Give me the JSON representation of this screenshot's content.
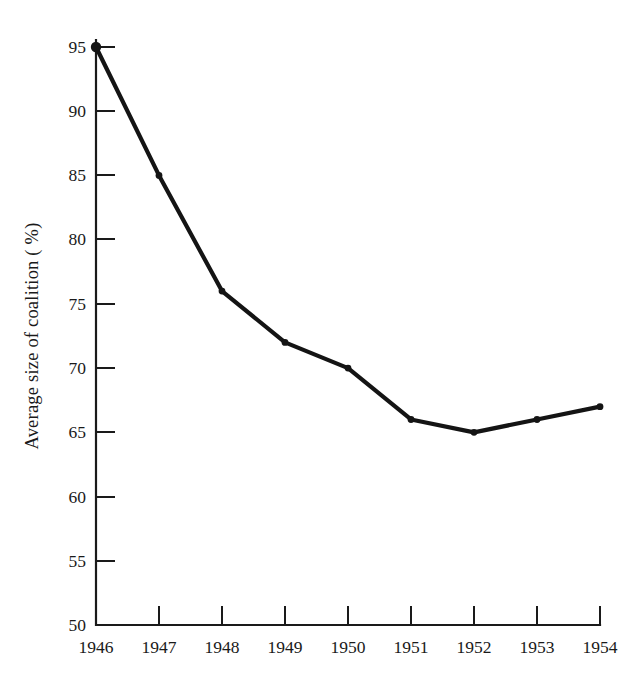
{
  "chart_data": {
    "type": "line",
    "title": "",
    "subtitle": "",
    "xlabel": "",
    "ylabel": "Average size of coalition ( %)",
    "x": [
      1946,
      1947,
      1948,
      1949,
      1950,
      1951,
      1952,
      1953,
      1954
    ],
    "categories": [
      "1946",
      "1947",
      "1948",
      "1949",
      "1950",
      "1951",
      "1952",
      "1953",
      "1954"
    ],
    "values": [
      95,
      85,
      76,
      72,
      70,
      66,
      65,
      66,
      67
    ],
    "series": [
      {
        "name": "Average size of coalition",
        "values": [
          95,
          85,
          76,
          72,
          70,
          66,
          65,
          66,
          67
        ]
      }
    ],
    "xlim": [
      1946,
      1954
    ],
    "ylim": [
      50,
      95
    ],
    "ytick_labels": [
      "50",
      "55",
      "60",
      "65",
      "70",
      "75",
      "80",
      "85",
      "90",
      "95"
    ],
    "ytick_values": [
      50,
      55,
      60,
      65,
      70,
      75,
      80,
      85,
      90,
      95
    ],
    "xtick_labels": [
      "1946",
      "1947",
      "1948",
      "1949",
      "1950",
      "1951",
      "1952",
      "1953",
      "1954"
    ],
    "grid": false,
    "legend": false,
    "legend_position": "none",
    "marker": "circle",
    "line_color": "#141414",
    "marker_color": "#141414",
    "axis_color": "#1a1a1a",
    "background_color": "#ffffff",
    "tick_direction": "in",
    "annotations": []
  },
  "axes": {
    "y_title": "Average size of coalition ( %)",
    "x_title": ""
  }
}
